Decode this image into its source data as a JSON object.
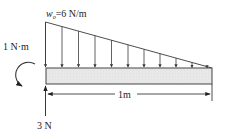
{
  "diagram": {
    "type": "beam-free-body",
    "colors": {
      "line": "#3a3a3a",
      "beam_fill": "#e6e6e6",
      "beam_stroke": "#444444",
      "text": "#222222"
    },
    "load": {
      "symbol": "w",
      "subscript": "o",
      "value_text": "=6 N/m",
      "label": "w_o=6 N/m",
      "shape": "triangular, max at left, zero at right",
      "arrow_count": 11
    },
    "moment": {
      "label": "1 N·m",
      "direction": "counterclockwise"
    },
    "reaction": {
      "label": "3 N",
      "direction": "up"
    },
    "dimension": {
      "label": "1m"
    }
  }
}
